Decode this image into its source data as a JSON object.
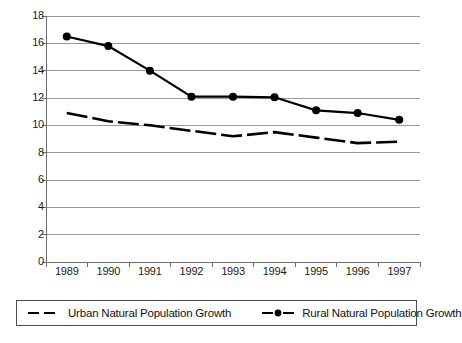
{
  "chart_data": {
    "type": "line",
    "title": "",
    "xlabel": "",
    "ylabel": "",
    "categories": [
      "1989",
      "1990",
      "1991",
      "1992",
      "1993",
      "1994",
      "1995",
      "1996",
      "1997"
    ],
    "ylim": [
      0,
      18
    ],
    "yticks": [
      0,
      2,
      4,
      6,
      8,
      10,
      12,
      14,
      16,
      18
    ],
    "grid": "horizontal",
    "legend_position": "bottom",
    "series": [
      {
        "name": "Urban Natural Population Growth",
        "style": "dashed",
        "marker": "none",
        "color": "#000000",
        "values": [
          10.9,
          10.3,
          10.0,
          9.6,
          9.2,
          9.5,
          9.1,
          8.7,
          8.8
        ]
      },
      {
        "name": "Rural Natural Population Growth",
        "style": "solid",
        "marker": "circle",
        "color": "#000000",
        "values": [
          16.5,
          15.8,
          14.0,
          12.1,
          12.1,
          12.05,
          11.1,
          10.9,
          10.4
        ]
      }
    ]
  },
  "axes": {
    "y_tick_labels": [
      "18",
      "16",
      "14",
      "12",
      "10",
      "8",
      "6",
      "4",
      "2",
      "0"
    ],
    "x_tick_labels": [
      "1989",
      "1990",
      "1991",
      "1992",
      "1993",
      "1994",
      "1995",
      "1996",
      "1997"
    ]
  },
  "legend": {
    "items": [
      {
        "label": "Urban Natural Population Growth",
        "key": "dashed-line-key"
      },
      {
        "label": "Rural Natural Population Growth",
        "key": "solid-line-marker-key"
      }
    ]
  },
  "colors": {
    "series_line": "#000000",
    "gridline": "#9a9a9a",
    "axis": "#6e6e6e",
    "text": "#111111",
    "background": "#ffffff",
    "legend_border": "#4d4d4d"
  }
}
